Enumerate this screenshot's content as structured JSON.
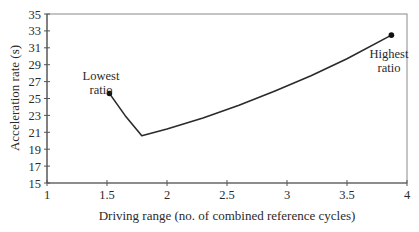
{
  "chart_data": {
    "type": "line",
    "title": "",
    "xlabel": "Driving range (no. of combined reference cycles)",
    "ylabel": "Acceleration rate (s)",
    "xlim": [
      1,
      4
    ],
    "ylim": [
      15,
      35
    ],
    "x_ticks": [
      1,
      1.5,
      2,
      2.5,
      3,
      3.5,
      4
    ],
    "x_tick_labels": [
      "1",
      "1.5",
      "2",
      "2.5",
      "3",
      "3.5",
      "4"
    ],
    "y_ticks": [
      15,
      17,
      19,
      21,
      23,
      25,
      27,
      29,
      31,
      33,
      35
    ],
    "y_tick_labels": [
      "15",
      "17",
      "19",
      "21",
      "23",
      "25",
      "27",
      "29",
      "31",
      "33",
      "35"
    ],
    "grid": false,
    "legend": null,
    "series": [
      {
        "name": "Acceleration vs driving range",
        "x": [
          1.52,
          1.65,
          1.79,
          2.0,
          2.3,
          2.6,
          2.9,
          3.2,
          3.5,
          3.87
        ],
        "y": [
          25.6,
          23.0,
          20.6,
          21.4,
          22.7,
          24.2,
          25.9,
          27.7,
          29.7,
          32.5
        ]
      }
    ],
    "markers": [
      {
        "x": 1.52,
        "y": 25.6,
        "label": "Lowest ratio"
      },
      {
        "x": 3.87,
        "y": 32.5,
        "label": "Highest ratio"
      }
    ],
    "annotations": [
      {
        "text_lines": [
          "Lowest",
          "ratio"
        ],
        "x": 1.45,
        "y": 27.2
      },
      {
        "text_lines": [
          "Highest",
          "ratio"
        ],
        "x": 3.85,
        "y": 29.8
      }
    ]
  }
}
